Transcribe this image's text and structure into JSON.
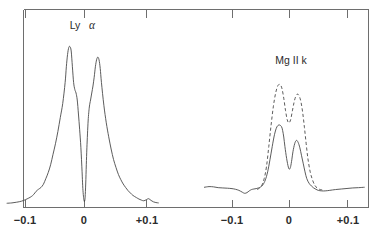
{
  "figure": {
    "title": "",
    "background_color": "#ffffff",
    "line_color": "#4a4a4a",
    "axis_color": "#6e6e6e"
  },
  "panels": [
    {
      "id": "lyman-alpha",
      "label_main": "Ly",
      "label_greek": "α",
      "label_full": "Ly α",
      "tick_labels": [
        "−0.1",
        "0",
        "+0.1"
      ],
      "tick_values": [
        -0.1,
        0,
        0.1
      ]
    },
    {
      "id": "mg-ii-k",
      "label_main": "Mg II k",
      "label_greek": "",
      "label_full": "Mg II k",
      "tick_labels": [
        "−0.1",
        "0",
        "+0.1"
      ],
      "tick_values": [
        -0.1,
        0,
        0.1
      ]
    }
  ],
  "chart_data": {
    "type": "line",
    "title": "",
    "xlabel": "",
    "ylabel": "",
    "grid": false,
    "legend": "none",
    "panels": [
      {
        "name": "Ly α",
        "xlim": [
          -0.13,
          0.125
        ],
        "ylim": [
          0,
          1.0
        ],
        "xticks": [
          -0.1,
          0,
          0.1
        ],
        "xticklabels": [
          "−0.1",
          "0",
          "+0.1"
        ],
        "series": [
          {
            "name": "Ly alpha profile",
            "style": "solid",
            "x": [
              -0.128,
              -0.12,
              -0.112,
              -0.104,
              -0.098,
              -0.092,
              -0.088,
              -0.084,
              -0.08,
              -0.076,
              -0.072,
              -0.068,
              -0.064,
              -0.06,
              -0.056,
              -0.052,
              -0.048,
              -0.044,
              -0.04,
              -0.036,
              -0.032,
              -0.03,
              -0.028,
              -0.026,
              -0.024,
              -0.022,
              -0.02,
              -0.018,
              -0.016,
              -0.014,
              -0.012,
              -0.01,
              -0.008,
              -0.006,
              -0.004,
              -0.003,
              -0.002,
              -0.001,
              0.0,
              0.001,
              0.002,
              0.003,
              0.004,
              0.006,
              0.008,
              0.01,
              0.012,
              0.014,
              0.016,
              0.018,
              0.02,
              0.022,
              0.024,
              0.026,
              0.028,
              0.032,
              0.036,
              0.04,
              0.044,
              0.048,
              0.052,
              0.056,
              0.06,
              0.064,
              0.068,
              0.072,
              0.076,
              0.08,
              0.086,
              0.09,
              0.094,
              0.098,
              0.102,
              0.106,
              0.11,
              0.114,
              0.118,
              0.122
            ],
            "y": [
              0.01,
              0.012,
              0.016,
              0.022,
              0.03,
              0.04,
              0.048,
              0.06,
              0.078,
              0.09,
              0.1,
              0.118,
              0.15,
              0.185,
              0.23,
              0.29,
              0.35,
              0.42,
              0.5,
              0.58,
              0.7,
              0.79,
              0.86,
              0.9,
              0.905,
              0.88,
              0.79,
              0.7,
              0.66,
              0.64,
              0.6,
              0.52,
              0.43,
              0.33,
              0.19,
              0.11,
              0.06,
              0.03,
              0.02,
              0.045,
              0.12,
              0.23,
              0.33,
              0.48,
              0.56,
              0.6,
              0.64,
              0.68,
              0.73,
              0.79,
              0.83,
              0.845,
              0.83,
              0.78,
              0.7,
              0.57,
              0.47,
              0.39,
              0.32,
              0.26,
              0.215,
              0.175,
              0.145,
              0.12,
              0.1,
              0.082,
              0.068,
              0.055,
              0.042,
              0.034,
              0.028,
              0.024,
              0.03,
              0.036,
              0.026,
              0.018,
              0.014,
              0.012
            ]
          }
        ]
      },
      {
        "name": "Mg II k",
        "xlim": [
          -0.155,
          0.135
        ],
        "ylim": [
          0,
          1.0
        ],
        "xticks": [
          -0.1,
          0,
          0.1
        ],
        "xticklabels": [
          "−0.1",
          "0",
          "+0.1"
        ],
        "series": [
          {
            "name": "Mg II k observed",
            "style": "solid",
            "x": [
              -0.148,
              -0.14,
              -0.132,
              -0.124,
              -0.116,
              -0.108,
              -0.1,
              -0.094,
              -0.088,
              -0.082,
              -0.078,
              -0.074,
              -0.07,
              -0.066,
              -0.062,
              -0.058,
              -0.054,
              -0.05,
              -0.046,
              -0.042,
              -0.038,
              -0.034,
              -0.03,
              -0.026,
              -0.022,
              -0.018,
              -0.014,
              -0.012,
              -0.01,
              -0.008,
              -0.005,
              -0.002,
              0.0,
              0.002,
              0.004,
              0.006,
              0.009,
              0.012,
              0.015,
              0.018,
              0.021,
              0.024,
              0.027,
              0.03,
              0.034,
              0.038,
              0.042,
              0.046,
              0.05,
              0.056,
              0.062,
              0.07,
              0.08,
              0.09,
              0.1,
              0.11,
              0.12,
              0.13
            ],
            "y": [
              0.095,
              0.1,
              0.098,
              0.092,
              0.09,
              0.088,
              0.085,
              0.08,
              0.072,
              0.058,
              0.05,
              0.055,
              0.068,
              0.078,
              0.082,
              0.085,
              0.09,
              0.098,
              0.115,
              0.15,
              0.21,
              0.3,
              0.4,
              0.49,
              0.545,
              0.56,
              0.548,
              0.52,
              0.47,
              0.4,
              0.31,
              0.245,
              0.23,
              0.25,
              0.3,
              0.36,
              0.42,
              0.445,
              0.43,
              0.39,
              0.33,
              0.27,
              0.21,
              0.16,
              0.125,
              0.105,
              0.09,
              0.08,
              0.072,
              0.068,
              0.068,
              0.072,
              0.078,
              0.082,
              0.086,
              0.09,
              0.092,
              0.095
            ]
          },
          {
            "name": "Mg II k model",
            "style": "dashed",
            "x": [
              -0.056,
              -0.052,
              -0.048,
              -0.044,
              -0.04,
              -0.036,
              -0.032,
              -0.028,
              -0.024,
              -0.02,
              -0.016,
              -0.013,
              -0.01,
              -0.007,
              -0.004,
              -0.001,
              0.002,
              0.005,
              0.008,
              0.011,
              0.014,
              0.017,
              0.02,
              0.023,
              0.026,
              0.029,
              0.032,
              0.036,
              0.04,
              0.044,
              0.048,
              0.052,
              0.056,
              0.06
            ],
            "y": [
              0.078,
              0.09,
              0.11,
              0.16,
              0.25,
              0.4,
              0.56,
              0.7,
              0.8,
              0.855,
              0.86,
              0.83,
              0.76,
              0.67,
              0.6,
              0.575,
              0.6,
              0.665,
              0.73,
              0.775,
              0.79,
              0.775,
              0.73,
              0.65,
              0.54,
              0.42,
              0.31,
              0.21,
              0.15,
              0.11,
              0.09,
              0.08,
              0.076,
              0.074
            ]
          }
        ]
      }
    ]
  }
}
